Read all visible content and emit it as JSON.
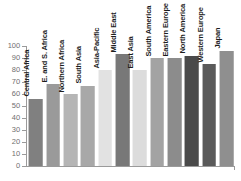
{
  "chart_data": {
    "type": "bar",
    "title": "",
    "subtitle": "",
    "xlabel": "",
    "ylabel": "",
    "ylim": [
      0,
      100
    ],
    "grid": false,
    "legend": "none",
    "orientation": "vertical",
    "yticks": [
      "100",
      "90",
      "80",
      "70",
      "60",
      "50",
      "40",
      "30",
      "20",
      "10",
      "0"
    ],
    "ytick_values": [
      100,
      90,
      80,
      70,
      60,
      50,
      40,
      30,
      20,
      10,
      0
    ],
    "categories": [
      "Central Africa",
      "E. and S. Africa",
      "Northern Africa",
      "South Asia",
      "Asia-Pacific",
      "Middle East",
      "East Asia",
      "South America",
      "Eastern Europe",
      "North America",
      "Western Europe",
      "Japan"
    ],
    "values": [
      56,
      68,
      60,
      67,
      80,
      93,
      80,
      90,
      90,
      92,
      85,
      96
    ],
    "bar_colors": [
      "#808080",
      "#9a9a9a",
      "#b5b5b5",
      "#a8a8a8",
      "#e2e2e2",
      "#787878",
      "#dcdcdc",
      "#a3a3a3",
      "#8c8c8c",
      "#4a4a4a",
      "#5a5a5a",
      "#8f8f8f"
    ],
    "axis_color": "#9a9a9a",
    "tick_label_color": "#6f6f6f",
    "category_label_color": "#1d1d1d",
    "background_color": "#ffffff"
  }
}
